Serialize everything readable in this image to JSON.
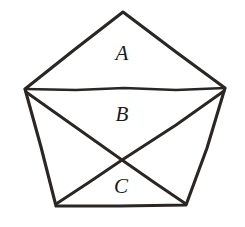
{
  "figure": {
    "shape_name": "pentagon",
    "background_color": "#ffffff",
    "stroke_color": "#2a2623",
    "label_color": "#1a1a1a",
    "canvas": {
      "width": 245,
      "height": 227
    },
    "vertices": [
      {
        "name": "apex",
        "x": 123,
        "y": 12
      },
      {
        "name": "upper-right",
        "x": 225,
        "y": 88
      },
      {
        "name": "lower-right",
        "x": 186,
        "y": 205
      },
      {
        "name": "lower-left",
        "x": 56,
        "y": 205
      },
      {
        "name": "upper-left",
        "x": 25,
        "y": 89
      }
    ],
    "outline_path": "M 123 12 L 176 52 L 225 88 L 207 148 L 186 205 L 120 206 L 56 206 L 41 147 L 25 89 L 74 50 Z",
    "chords": [
      {
        "name": "horizontal-chord",
        "from": "upper-left",
        "to": "upper-right",
        "path": "M 25 89 L 76 90 L 124 88 L 176 90 L 225 88"
      },
      {
        "name": "diagonal-upper-left-to-lower-right",
        "from": "upper-left",
        "to": "lower-right",
        "path": "M 26 92 L 74 126 L 122 160 L 155 183 L 186 204"
      },
      {
        "name": "diagonal-upper-right-to-lower-left",
        "from": "upper-right",
        "to": "lower-left",
        "path": "M 224 91 L 176 125 L 122 160 L 88 183 L 56 204"
      }
    ],
    "intersection": {
      "name": "diagonal-crossing",
      "x": 122,
      "y": 160
    },
    "regions": [
      {
        "id": "A",
        "label": "A",
        "position": "top",
        "x": 122,
        "y": 60
      },
      {
        "id": "B",
        "label": "B",
        "position": "middle",
        "x": 122,
        "y": 121
      },
      {
        "id": "C",
        "label": "C",
        "position": "bottom",
        "x": 121,
        "y": 193
      }
    ]
  }
}
